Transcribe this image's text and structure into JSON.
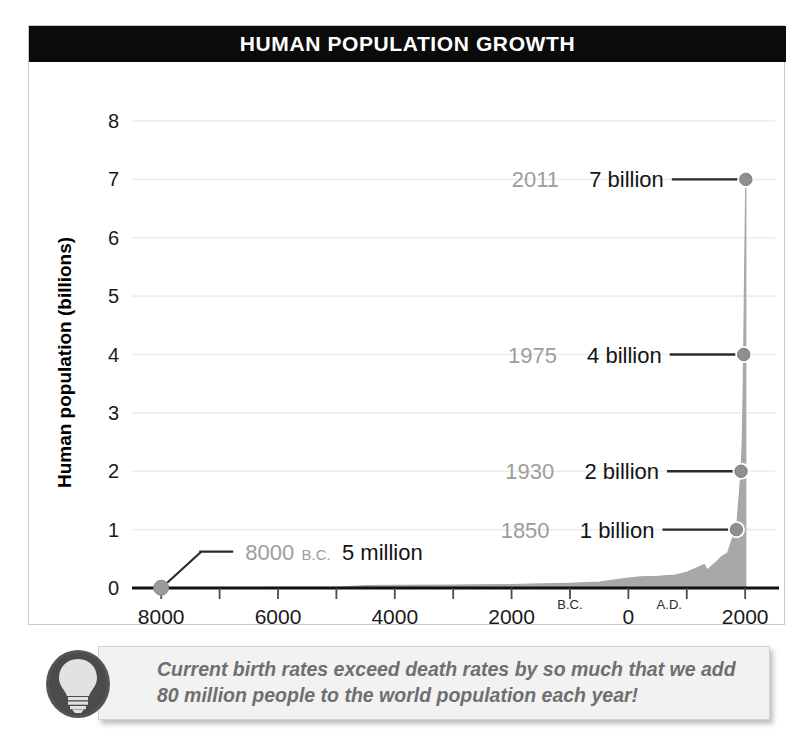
{
  "figure": {
    "title": "HUMAN POPULATION GROWTH",
    "caption": "Current birth rates exceed death rates by so much that we add 80 million people to the world population each year!",
    "bulb_icon": "lightbulb-icon",
    "colors": {
      "title_bar": "#0b0b0b",
      "title_text": "#ffffff",
      "curve_fill": "#a8a8a8",
      "annotation_year": "#9d9d9d",
      "annotation_value": "#141414",
      "gridline": "#ededed",
      "axis": "#111111",
      "caption_text": "#6f6f6f",
      "caption_bg": "#f2f2f2",
      "badge_circle": "#555555"
    }
  },
  "chart_data": {
    "type": "area",
    "title": "HUMAN POPULATION GROWTH",
    "xlabel": "Year",
    "ylabel": "Human population (billions)",
    "ylim": [
      0,
      8
    ],
    "yticks": [
      0,
      1,
      2,
      3,
      4,
      5,
      6,
      7,
      8
    ],
    "ytick_labels": [
      "0",
      "1",
      "2",
      "3",
      "4",
      "5",
      "6",
      "7",
      "8"
    ],
    "xlim": [
      -8500,
      2100
    ],
    "xticks": [
      -8000,
      -7000,
      -6000,
      -5000,
      -4000,
      -3000,
      -2000,
      -1000,
      0,
      1000,
      2000
    ],
    "xtick_labels": [
      "8000",
      "",
      "6000",
      "",
      "4000",
      "",
      "2000",
      "",
      "0",
      "",
      "2000"
    ],
    "era_labels": [
      {
        "text": "B.C.",
        "x": -1000
      },
      {
        "text": "A.D.",
        "x": 700
      }
    ],
    "grid": true,
    "legend": "none",
    "x_unit": "year (negative = B.C.)",
    "y_unit": "billions of people",
    "x": [
      -8000,
      -7000,
      -6000,
      -5000,
      -4500,
      -4000,
      -3000,
      -2000,
      -1500,
      -1000,
      -500,
      0,
      200,
      500,
      800,
      1000,
      1200,
      1300,
      1350,
      1400,
      1500,
      1600,
      1700,
      1750,
      1800,
      1850,
      1900,
      1930,
      1950,
      1960,
      1975,
      1990,
      2000,
      2011
    ],
    "y": [
      0.005,
      0.007,
      0.01,
      0.012,
      0.04,
      0.045,
      0.05,
      0.06,
      0.07,
      0.08,
      0.1,
      0.17,
      0.19,
      0.2,
      0.22,
      0.27,
      0.36,
      0.4,
      0.31,
      0.35,
      0.44,
      0.54,
      0.6,
      0.75,
      0.9,
      1.0,
      1.6,
      2.0,
      2.5,
      3.0,
      4.0,
      5.3,
      6.1,
      7.0
    ],
    "annotations": [
      {
        "id": "ann-8000bc",
        "year_label": "8000",
        "era_label": "B.C.",
        "value_label": "5 million",
        "x": -8000,
        "y": 0.005,
        "leader": "up-right-diagonal"
      },
      {
        "id": "ann-1850",
        "year_label": "1850",
        "era_label": "",
        "value_label": "1 billion",
        "x": 1850,
        "y": 1.0,
        "leader": "left-horizontal"
      },
      {
        "id": "ann-1930",
        "year_label": "1930",
        "era_label": "",
        "value_label": "2 billion",
        "x": 1930,
        "y": 2.0,
        "leader": "left-horizontal"
      },
      {
        "id": "ann-1975",
        "year_label": "1975",
        "era_label": "",
        "value_label": "4 billion",
        "x": 1975,
        "y": 4.0,
        "leader": "left-horizontal"
      },
      {
        "id": "ann-2011",
        "year_label": "2011",
        "era_label": "",
        "value_label": "7 billion",
        "x": 2011,
        "y": 7.0,
        "leader": "left-horizontal"
      }
    ]
  }
}
